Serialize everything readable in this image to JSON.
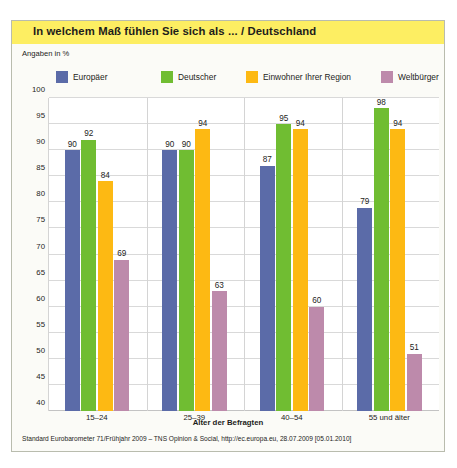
{
  "figure": {
    "title": "In welchem Maß fühlen Sie sich als ... / Deutschland",
    "unit_label": "Angaben in %",
    "source": "Standard Eurobarometer 71/Frühjahr 2009 – TNS Opinion & Social, http://ec.europa.eu, 28.07.2009 [05.01.2010]",
    "title_band_color": "#fdee62",
    "border_color": "#b9bcae"
  },
  "chart_data": {
    "type": "bar",
    "title": "In welchem Maß fühlen Sie sich als ... / Deutschland",
    "xlabel": "Alter der Befragten",
    "ylabel": "Angaben in %",
    "ylim": [
      40,
      100
    ],
    "ytick_step": 5,
    "yticks": [
      100,
      95,
      90,
      85,
      80,
      75,
      70,
      65,
      60,
      55,
      50,
      45,
      40
    ],
    "grid": true,
    "legend_position": "top",
    "categories": [
      "15–24",
      "25–39",
      "40–54",
      "55 und älter"
    ],
    "series": [
      {
        "name": "Europäer",
        "color": "#5b6ba8",
        "values": [
          90,
          90,
          87,
          79
        ]
      },
      {
        "name": "Deutscher",
        "color": "#70bd32",
        "values": [
          92,
          90,
          95,
          98
        ]
      },
      {
        "name": "Einwohner Ihrer Region",
        "color": "#fdb913",
        "values": [
          84,
          94,
          94,
          94
        ]
      },
      {
        "name": "Weltbürger",
        "color": "#bd8aab",
        "values": [
          69,
          63,
          60,
          51
        ]
      }
    ]
  }
}
